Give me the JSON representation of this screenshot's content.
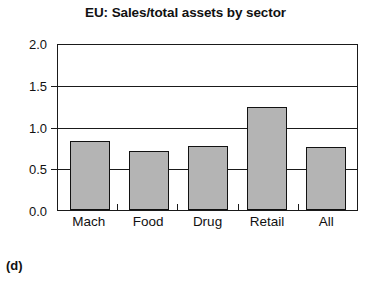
{
  "chart_data": {
    "type": "bar",
    "title": "EU: Sales/total assets by sector",
    "xlabel": "",
    "ylabel": "",
    "categories": [
      "Mach",
      "Food",
      "Drug",
      "Retail",
      "All"
    ],
    "values": [
      0.84,
      0.72,
      0.78,
      1.25,
      0.76
    ],
    "ylim": [
      0.0,
      2.0
    ],
    "ytick_labels": [
      "0.0",
      "0.5",
      "1.0",
      "1.5",
      "2.0"
    ],
    "ytick_values": [
      0.0,
      0.5,
      1.0,
      1.5,
      2.0
    ],
    "gridlines": [
      0.5,
      1.0,
      1.5
    ],
    "grid": true,
    "legend": "none",
    "bar_fill_color": "#b4b4b4",
    "bar_edge_color": "#121212",
    "axis_color": "#1a1a1a",
    "background_color": "#ffffff"
  },
  "caption": {
    "label": "(d)"
  }
}
